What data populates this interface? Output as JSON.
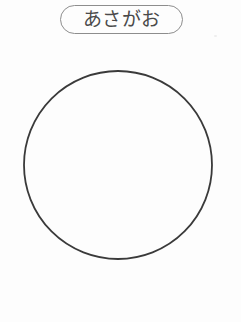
{
  "page": {
    "background_color": "#fdfdfd",
    "width": 241,
    "height": 322,
    "kind": "observation-worksheet"
  },
  "label": {
    "text": "あさがお",
    "romaji_meaning": "asagao",
    "shape": "rounded-rectangle-pill",
    "stroke_color": "#8d8d8d",
    "text_color": "#4a4a4a",
    "font_size_px": 19,
    "x": 60,
    "y": 5,
    "width": 123,
    "height": 29,
    "corner_radius": 15
  },
  "drawing": {
    "shape_name": "circle-outline",
    "center_x": 118,
    "center_y": 165,
    "radius": 94,
    "stroke_color": "#3a3a3a",
    "stroke_width": 1.8,
    "fill": "none"
  },
  "artifacts": {
    "speck_color": "#ededed",
    "speck_x": 214,
    "speck_y": 35
  }
}
